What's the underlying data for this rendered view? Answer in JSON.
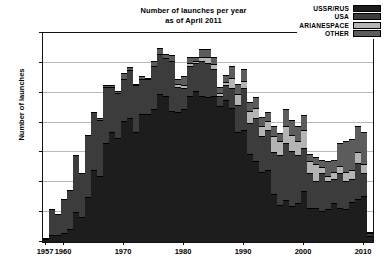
{
  "chart_data": {
    "type": "bar",
    "title": "Number of launches per year",
    "subtitle": "as of April 2011",
    "xlabel": "",
    "ylabel": "Number of launches",
    "ylim": [
      0,
      140
    ],
    "ytick_step": 20,
    "yticks": [
      0,
      20,
      40,
      60,
      80,
      100,
      120,
      140
    ],
    "xlim": [
      1956.5,
      2011.5
    ],
    "xticks": [
      1957,
      1960,
      1970,
      1980,
      1990,
      2000,
      2010
    ],
    "xtick_labels": [
      "1957",
      "1960",
      "1970",
      "1980",
      "1990",
      "2000",
      "2010"
    ],
    "grid": true,
    "grid_axis": "y",
    "stacked": true,
    "legend_position": "top-right",
    "colors": {
      "USSR/RUS": "#1d1d1d",
      "USA": "#3c3c3c",
      "ARIANESPACE": "#b4b4b4",
      "OTHER": "#5c5c5c"
    },
    "categories": [
      1957,
      1958,
      1959,
      1960,
      1961,
      1962,
      1963,
      1964,
      1965,
      1966,
      1967,
      1968,
      1969,
      1970,
      1971,
      1972,
      1973,
      1974,
      1975,
      1976,
      1977,
      1978,
      1979,
      1980,
      1981,
      1982,
      1983,
      1984,
      1985,
      1986,
      1987,
      1988,
      1989,
      1990,
      1991,
      1992,
      1993,
      1994,
      1995,
      1996,
      1997,
      1998,
      1999,
      2000,
      2001,
      2002,
      2003,
      2004,
      2005,
      2006,
      2007,
      2008,
      2009,
      2010,
      2011
    ],
    "series": [
      {
        "name": "USSR/RUS",
        "values": [
          2,
          5,
          5,
          6,
          9,
          20,
          17,
          30,
          48,
          44,
          66,
          74,
          70,
          81,
          83,
          74,
          86,
          86,
          89,
          99,
          98,
          88,
          87,
          89,
          98,
          101,
          98,
          97,
          98,
          91,
          95,
          90,
          74,
          75,
          59,
          54,
          47,
          48,
          32,
          25,
          28,
          24,
          26,
          34,
          23,
          23,
          21,
          22,
          26,
          23,
          22,
          27,
          29,
          31,
          4
        ]
      },
      {
        "name": "USA",
        "values": [
          1,
          17,
          14,
          23,
          26,
          38,
          29,
          42,
          39,
          38,
          38,
          30,
          30,
          28,
          32,
          31,
          23,
          23,
          29,
          27,
          25,
          33,
          17,
          14,
          20,
          19,
          23,
          23,
          18,
          7,
          10,
          13,
          18,
          28,
          21,
          29,
          24,
          27,
          28,
          33,
          38,
          37,
          32,
          29,
          23,
          18,
          25,
          19,
          16,
          23,
          19,
          15,
          24,
          15,
          2
        ]
      },
      {
        "name": "ARIANESPACE",
        "values": [
          0,
          0,
          0,
          0,
          0,
          0,
          0,
          0,
          0,
          0,
          0,
          0,
          0,
          0,
          0,
          0,
          0,
          0,
          0,
          0,
          0,
          0,
          2,
          2,
          2,
          1,
          3,
          4,
          3,
          2,
          2,
          7,
          7,
          5,
          8,
          7,
          7,
          6,
          11,
          10,
          12,
          11,
          10,
          12,
          8,
          11,
          4,
          3,
          5,
          5,
          6,
          6,
          7,
          6,
          1
        ]
      },
      {
        "name": "OTHER",
        "values": [
          0,
          0,
          0,
          0,
          0,
          0,
          0,
          0,
          0,
          1,
          1,
          1,
          1,
          4,
          2,
          1,
          2,
          1,
          3,
          4,
          3,
          4,
          3,
          6,
          4,
          3,
          5,
          5,
          5,
          4,
          5,
          8,
          7,
          8,
          6,
          7,
          6,
          6,
          7,
          5,
          11,
          10,
          10,
          10,
          5,
          5,
          5,
          10,
          8,
          15,
          21,
          21,
          18,
          22,
          0
        ]
      }
    ]
  },
  "legend": {
    "items": [
      {
        "label": "USSR/RUS",
        "color": "#1d1d1d"
      },
      {
        "label": "USA",
        "color": "#3c3c3c"
      },
      {
        "label": "ARIANESPACE",
        "color": "#b4b4b4"
      },
      {
        "label": "OTHER",
        "color": "#5c5c5c"
      }
    ]
  }
}
